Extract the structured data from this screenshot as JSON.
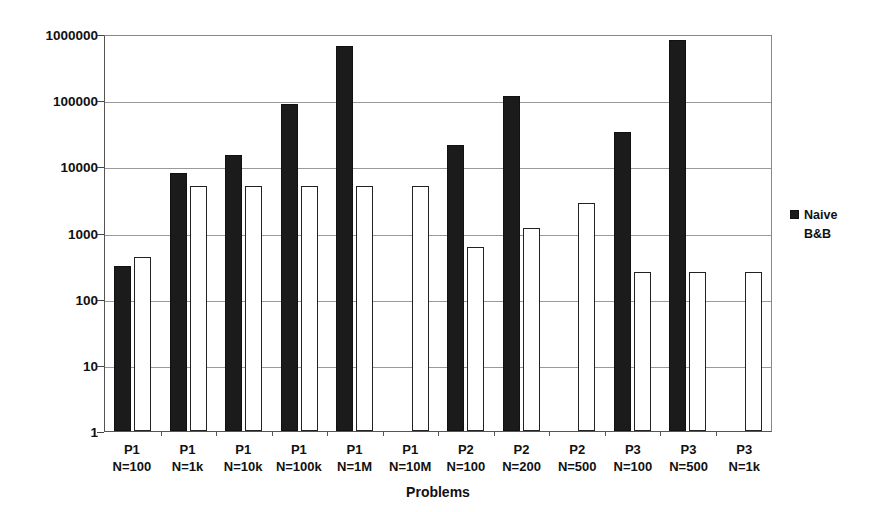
{
  "chart_data": {
    "type": "bar",
    "title": "",
    "xlabel": "Problems",
    "ylabel": "Total memory used [kBytes]",
    "yscale": "log",
    "ylim": [
      1,
      1000000
    ],
    "yticks": [
      1,
      10,
      100,
      1000,
      10000,
      100000,
      1000000
    ],
    "ytick_labels": [
      "1",
      "10",
      "100",
      "1000",
      "10000",
      "100000",
      "1000000"
    ],
    "grid": true,
    "legend_position": "right",
    "categories": [
      "P1\nN=100",
      "P1\nN=1k",
      "P1\nN=10k",
      "P1\nN=100k",
      "P1\nN=1M",
      "P1\nN=10M",
      "P2\nN=100",
      "P2\nN=200",
      "P2\nN=500",
      "P3\nN=100",
      "P3\nN=500",
      "P3\nN=1k"
    ],
    "category_lines": [
      {
        "problem": "P1",
        "size": "N=100"
      },
      {
        "problem": "P1",
        "size": "N=1k"
      },
      {
        "problem": "P1",
        "size": "N=10k"
      },
      {
        "problem": "P1",
        "size": "N=100k"
      },
      {
        "problem": "P1",
        "size": "N=1M"
      },
      {
        "problem": "P1",
        "size": "N=10M"
      },
      {
        "problem": "P2",
        "size": "N=100"
      },
      {
        "problem": "P2",
        "size": "N=200"
      },
      {
        "problem": "P2",
        "size": "N=500"
      },
      {
        "problem": "P3",
        "size": "N=100"
      },
      {
        "problem": "P3",
        "size": "N=500"
      },
      {
        "problem": "P3",
        "size": "N=1k"
      }
    ],
    "series": [
      {
        "name": "Naive",
        "color": "#1b1b1b",
        "values": [
          310,
          7800,
          15000,
          88000,
          650000,
          null,
          21000,
          115000,
          null,
          33000,
          800000,
          null
        ]
      },
      {
        "name": "B&B",
        "color": "#ffffff",
        "values": [
          420,
          5000,
          5000,
          5000,
          5000,
          5000,
          600,
          1150,
          2800,
          250,
          250,
          250
        ]
      }
    ]
  },
  "legend": {
    "entries": [
      {
        "label": "Naive",
        "marker": "filled-square"
      },
      {
        "label": "B&B",
        "marker": "open-square"
      }
    ]
  },
  "axes": {
    "x_title": "Problems",
    "y_title": "Total memory used [kBytes]"
  }
}
